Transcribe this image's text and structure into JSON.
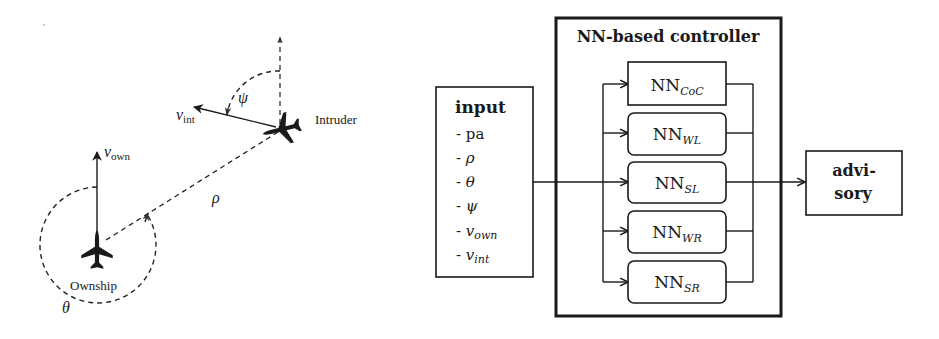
{
  "geometry_figure": {
    "ownship_label": "Ownship",
    "intruder_label": "Intruder",
    "v_own": {
      "base": "v",
      "sub": "own"
    },
    "v_int": {
      "base": "v",
      "sub": "int"
    },
    "rho": "ρ",
    "theta": "θ",
    "psi": "ψ"
  },
  "block_diagram": {
    "input": {
      "title": "input",
      "items": [
        {
          "prefix": "- ",
          "base": "pa",
          "sub": ""
        },
        {
          "prefix": "- ",
          "base": "ρ",
          "sub": ""
        },
        {
          "prefix": "- ",
          "base": "θ",
          "sub": ""
        },
        {
          "prefix": "- ",
          "base": "ψ",
          "sub": ""
        },
        {
          "prefix": "- ",
          "base": "v",
          "sub": "own"
        },
        {
          "prefix": "- ",
          "base": "v",
          "sub": "int"
        }
      ]
    },
    "controller": {
      "title": "NN-based controller",
      "networks": [
        {
          "base": "NN",
          "sub": "CoC"
        },
        {
          "base": "NN",
          "sub": "WL"
        },
        {
          "base": "NN",
          "sub": "SL"
        },
        {
          "base": "NN",
          "sub": "WR"
        },
        {
          "base": "NN",
          "sub": "SR"
        }
      ]
    },
    "output": {
      "line1": "advi-",
      "line2": "sory"
    }
  }
}
